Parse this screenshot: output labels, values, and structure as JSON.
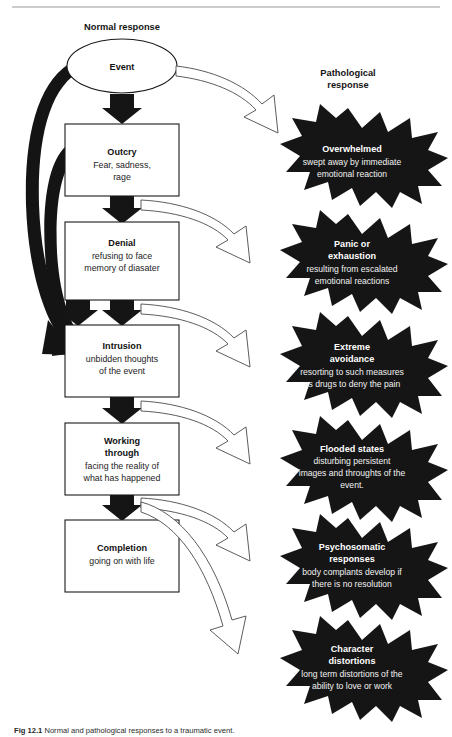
{
  "figure": {
    "top_rule": true,
    "caption_label": "Fig 12.1",
    "caption_text": "Normal and pathological responses to a traumatic event.",
    "columns": {
      "normal_label": "Normal response",
      "pathological_label_line1": "Pathological",
      "pathological_label_line2": "response"
    }
  },
  "normal_flow": {
    "event": {
      "shape": "ellipse",
      "title": "Event",
      "sub": []
    },
    "stages": [
      {
        "id": "outcry",
        "title": "Outcry",
        "sub": [
          "Fear, sadness,",
          "rage"
        ]
      },
      {
        "id": "denial",
        "title": "Denial",
        "sub": [
          "refusing to face",
          "memory of diasater"
        ]
      },
      {
        "id": "intrusion",
        "title": "Intrusion",
        "sub": [
          "unbidden thoughts",
          "of the event"
        ]
      },
      {
        "id": "working-through",
        "title_lines": [
          "Working",
          "through"
        ],
        "title": "Working through",
        "sub": [
          "facing the reality of",
          "what has happened"
        ]
      },
      {
        "id": "completion",
        "title": "Completion",
        "sub": [
          "going on with life"
        ]
      }
    ]
  },
  "pathological_responses": [
    {
      "id": "overwhelmed",
      "title_lines": [
        "Overwhelmed"
      ],
      "sub": [
        "swept away by immediate",
        "emotional reaction"
      ]
    },
    {
      "id": "panic-or-exhaustion",
      "title_lines": [
        "Panic or",
        "exhaustion"
      ],
      "sub": [
        "resulting from escalated",
        "emotional reactions"
      ]
    },
    {
      "id": "extreme-avoidance",
      "title_lines": [
        "Extreme",
        "avoidance"
      ],
      "sub": [
        "resorting to such measures",
        "as drugs to deny the pain"
      ]
    },
    {
      "id": "flooded-states",
      "title_lines": [
        "Flooded states"
      ],
      "sub": [
        "disturbing persistent",
        "images and throughts of the",
        "event."
      ]
    },
    {
      "id": "psychosomatic-responses",
      "title_lines": [
        "Psychosomatic",
        "responses"
      ],
      "sub": [
        "body complants develop if",
        "there is no resolution"
      ]
    },
    {
      "id": "character-distortions",
      "title_lines": [
        "Character",
        "distortions"
      ],
      "sub": [
        "long term distortions of the",
        "ability to love or work"
      ]
    }
  ],
  "colors": {
    "burst_fill": "#151515",
    "box_stroke": "#1a1a1a",
    "burst_text": "#ffffff",
    "page_bg": "#ffffff",
    "hollow_arrow_stroke": "#4a4a4a"
  }
}
